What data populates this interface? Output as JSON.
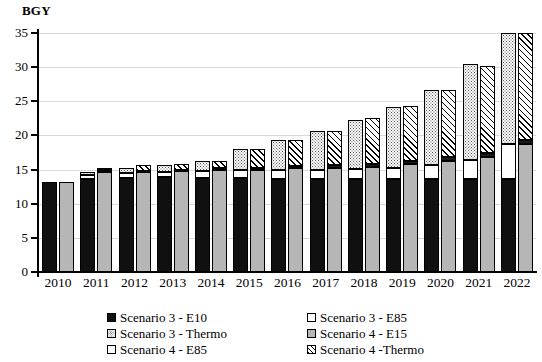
{
  "chart_data": {
    "type": "bar",
    "subtype": "grouped-stacked",
    "title": "",
    "subtitle": "",
    "xlabel": "",
    "ylabel": "BGY",
    "ylim": [
      0,
      35
    ],
    "ytick_step": 5,
    "ytick_labels": [
      "0",
      "5",
      "10",
      "15",
      "20",
      "25",
      "30",
      "35"
    ],
    "ytick_values": [
      0,
      5,
      10,
      15,
      20,
      25,
      30,
      35
    ],
    "grid": true,
    "grid_axis": "y",
    "legend_position": "bottom",
    "categories": [
      "2010",
      "2011",
      "2012",
      "2013",
      "2014",
      "2015",
      "2016",
      "2017",
      "2018",
      "2019",
      "2020",
      "2021",
      "2022"
    ],
    "groups": [
      {
        "name": "Scenario 3",
        "series": [
          {
            "name": "Scenario 3 - E10",
            "key": "s3_e10",
            "fill": "solid-black",
            "color": "#101010",
            "values": [
              13.2,
              13.6,
              13.8,
              13.9,
              13.8,
              13.7,
              13.6,
              13.6,
              13.6,
              13.6,
              13.6,
              13.6,
              13.6
            ]
          },
          {
            "name": "Scenario 3 - E85",
            "key": "s3_e85",
            "fill": "white",
            "color": "#ffffff",
            "values": [
              0.0,
              0.6,
              0.7,
              0.8,
              1.0,
              1.2,
              1.3,
              1.4,
              1.5,
              1.6,
              2.0,
              2.8,
              5.1
            ]
          },
          {
            "name": "Scenario 3 - Thermo",
            "key": "s3_thermo",
            "fill": "dotted",
            "color": "#ffffff",
            "values": [
              0.0,
              0.5,
              0.7,
              0.9,
              1.4,
              3.1,
              4.4,
              5.6,
              7.2,
              9.0,
              11.1,
              14.0,
              16.3
            ]
          }
        ]
      },
      {
        "name": "Scenario 4",
        "series": [
          {
            "name": "Scenario 4 - E15",
            "key": "s4_e15",
            "fill": "gray",
            "color": "#b6b6b6",
            "values": [
              13.2,
              14.7,
              14.6,
              14.8,
              14.9,
              15.0,
              15.2,
              15.3,
              15.4,
              15.8,
              16.3,
              16.8,
              18.8
            ]
          },
          {
            "name": "Scenario 4 - E85",
            "key": "s4_e85",
            "fill": "white-thin",
            "color": "#ffffff",
            "values": [
              0.0,
              0.2,
              0.2,
              0.2,
              0.3,
              0.3,
              0.3,
              0.4,
              0.4,
              0.4,
              0.5,
              0.6,
              0.6
            ]
          },
          {
            "name": "Scenario 4 - Thermo",
            "key": "s4_thermo",
            "fill": "hatched",
            "color": "#ffffff",
            "values": [
              0.0,
              0.1,
              0.8,
              0.8,
              1.0,
              2.7,
              3.8,
              4.9,
              6.7,
              8.1,
              9.9,
              12.7,
              15.6
            ]
          }
        ]
      }
    ],
    "totals_scenario3": [
      13.2,
      14.7,
      15.2,
      15.6,
      16.2,
      18.0,
      19.3,
      20.6,
      22.3,
      24.2,
      26.7,
      30.4,
      35.0
    ],
    "totals_scenario4": [
      13.2,
      15.0,
      15.6,
      15.8,
      16.2,
      18.0,
      19.3,
      20.6,
      22.5,
      24.3,
      26.7,
      30.1,
      35.0
    ]
  },
  "axis": {
    "y_title": "BGY"
  },
  "legend": {
    "items": [
      {
        "label": "Scenario 3 - E10",
        "swatch": "solid-black-swatch"
      },
      {
        "label": "Scenario 3 - E85",
        "swatch": "white-swatch"
      },
      {
        "label": "Scenario 3 - Thermo",
        "swatch": "dotted-swatch"
      },
      {
        "label": "Scenario 4 - E15",
        "swatch": "gray-swatch"
      },
      {
        "label": "Scenario 4 - E85",
        "swatch": "white-swatch"
      },
      {
        "label": "Scenario 4 -Thermo",
        "swatch": "hatched-swatch"
      }
    ]
  }
}
